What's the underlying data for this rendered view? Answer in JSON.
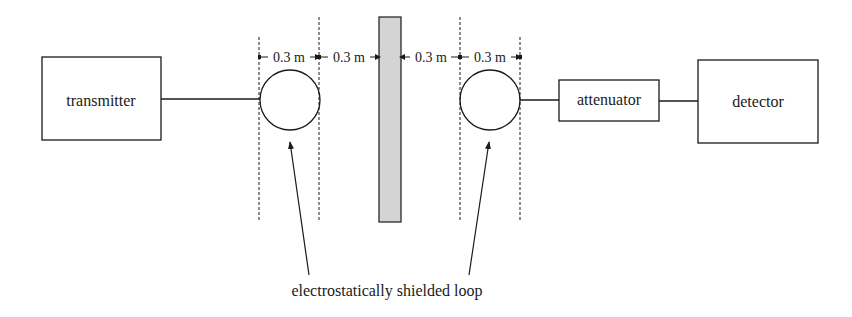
{
  "diagram": {
    "blocks": {
      "transmitter": "transmitter",
      "attenuator": "attenuator",
      "detector": "detector"
    },
    "dimensions": [
      "0.3 m",
      "0.3 m",
      "0.3 m",
      "0.3 m"
    ],
    "caption": "electrostatically shielded loop",
    "colors": {
      "stroke": "#1a1a1a",
      "shield_fill": "#d4d4d4"
    }
  }
}
